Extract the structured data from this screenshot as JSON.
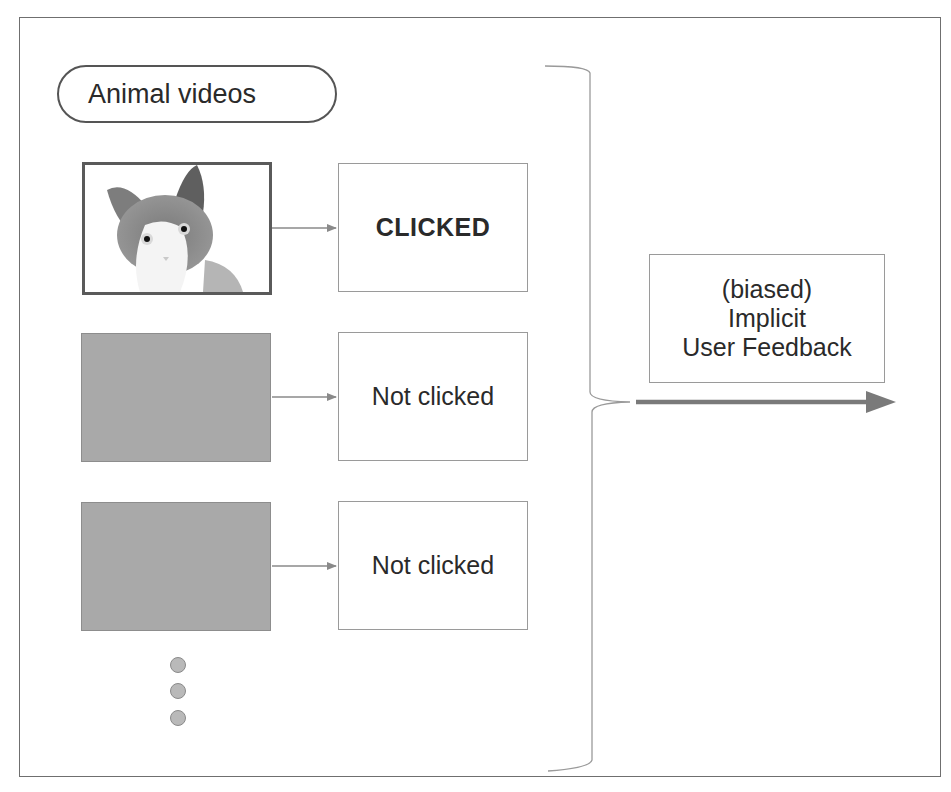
{
  "diagram": {
    "category_label": "Animal videos",
    "rows": [
      {
        "thumbnail": "cat-photo",
        "outcome": "CLICKED",
        "emphasis": "bold"
      },
      {
        "thumbnail": "gray-placeholder",
        "outcome": "Not clicked",
        "emphasis": "normal"
      },
      {
        "thumbnail": "gray-placeholder",
        "outcome": "Not clicked",
        "emphasis": "normal"
      }
    ],
    "continuation": "vertical-ellipsis-dots",
    "result_box": {
      "line1": "(biased)",
      "line2": "Implicit",
      "line3": "User Feedback"
    },
    "colors": {
      "frame": "#6f6f6f",
      "placeholder_fill": "#a9a9a9",
      "arrow": "#808080",
      "text": "#2a2a2a"
    }
  }
}
